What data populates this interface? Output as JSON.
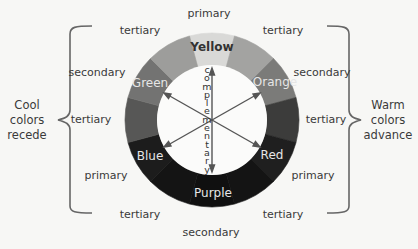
{
  "diagram": {
    "type": "color-wheel",
    "segments": [
      {
        "name": "Yellow",
        "category": "primary",
        "gray": "#d9d9d7"
      },
      {
        "name": "yellow-orange",
        "category": "tertiary",
        "gray": "#a3a3a1"
      },
      {
        "name": "Orange",
        "category": "secondary",
        "gray": "#7b7b79"
      },
      {
        "name": "red-orange",
        "category": "tertiary",
        "gray": "#3c3c3b"
      },
      {
        "name": "Red",
        "category": "primary",
        "gray": "#1f1f1f"
      },
      {
        "name": "red-purple",
        "category": "tertiary",
        "gray": "#141414"
      },
      {
        "name": "Purple",
        "category": "secondary",
        "gray": "#101010"
      },
      {
        "name": "blue-purple",
        "category": "tertiary",
        "gray": "#141414"
      },
      {
        "name": "Blue",
        "category": "primary",
        "gray": "#1c1c1c"
      },
      {
        "name": "blue-green",
        "category": "tertiary",
        "gray": "#575756"
      },
      {
        "name": "Green",
        "category": "secondary",
        "gray": "#737372"
      },
      {
        "name": "yellow-green",
        "category": "tertiary",
        "gray": "#9d9d9b"
      }
    ],
    "wheel_labels": {
      "yellow": "Yellow",
      "orange": "Orange",
      "red": "Red",
      "purple": "Purple",
      "blue": "Blue",
      "green": "Green"
    },
    "center_label": "complementary",
    "center_letters": [
      "c",
      "o",
      "m",
      "p",
      "l",
      "e",
      "m",
      "e",
      "n",
      "t",
      "a",
      "r",
      "y"
    ],
    "outer_labels": {
      "top": "primary",
      "top_left": "tertiary",
      "top_right": "tertiary",
      "upper_left": "secondary",
      "upper_right": "secondary",
      "mid_left": "tertiary",
      "mid_right": "tertiary",
      "lower_left": "primary",
      "lower_right": "primary",
      "bottom_left": "tertiary",
      "bottom_right": "tertiary",
      "bottom": "secondary"
    },
    "groups": {
      "cool": {
        "line1": "Cool",
        "line2": "colors",
        "line3": "recede"
      },
      "warm": {
        "line1": "Warm",
        "line2": "colors",
        "line3": "advance"
      }
    }
  }
}
